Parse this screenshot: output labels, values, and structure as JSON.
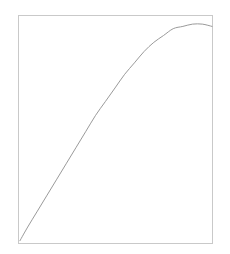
{
  "figure": {
    "width": 230,
    "height": 254,
    "background_color": "#ffffff"
  },
  "plot_frame": {
    "left": 18,
    "top": 15,
    "right": 212,
    "bottom": 243,
    "border_color": "#c9c9c9",
    "border_width": 1
  },
  "chart_data": {
    "type": "line",
    "title": "",
    "subtitle": "",
    "xlabel": "",
    "ylabel": "",
    "legend": [],
    "legend_position": "none",
    "grid": false,
    "axis_ticks": false,
    "tick_labels": false,
    "xlim": [
      0,
      100
    ],
    "ylim": [
      0,
      100
    ],
    "line_color": "#9a9a9a",
    "line_width": 1,
    "series": [
      {
        "name": "curve",
        "x": [
          1,
          5,
          10,
          15,
          20,
          25,
          30,
          35,
          40,
          45,
          50,
          55,
          60,
          65,
          70,
          75,
          80,
          85,
          90,
          95,
          100
        ],
        "y": [
          1,
          7,
          14,
          21,
          28,
          35,
          42,
          49,
          56,
          62,
          68,
          74,
          79,
          84,
          88,
          91,
          94,
          95,
          96,
          96,
          95
        ]
      }
    ]
  }
}
